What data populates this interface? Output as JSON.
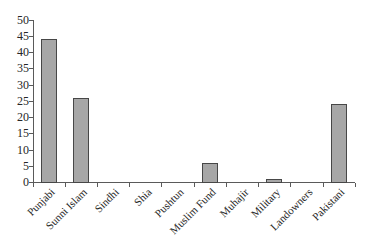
{
  "chart_data": {
    "type": "bar",
    "title": "",
    "xlabel": "",
    "ylabel": "",
    "categories": [
      "Punjabi",
      "Sunni Islam",
      "Sindhi",
      "Shia",
      "Pushtun",
      "Muslim Fund",
      "Muhajir",
      "Military",
      "Landowners",
      "Pakistani"
    ],
    "values": [
      44,
      26,
      0,
      0,
      0,
      6,
      0,
      1,
      0,
      24
    ],
    "ylim": [
      0,
      50
    ],
    "yticks": [
      0,
      5,
      10,
      15,
      20,
      25,
      30,
      35,
      40,
      45,
      50
    ],
    "grid": false,
    "legend": "none",
    "x_label_rotation_deg": -45,
    "colors": {
      "bar_fill": "#a7a7a7",
      "bar_border": "#474747",
      "axis": "#5a5a5a",
      "text": "#262626",
      "background": "#ffffff"
    }
  }
}
